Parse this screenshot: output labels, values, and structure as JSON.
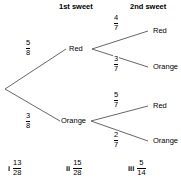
{
  "headers": {
    "first": "1st sweet",
    "second": "2nd sweet"
  },
  "tree": {
    "root_label": "",
    "level1": [
      {
        "label": "Red",
        "probability": {
          "numerator": "5",
          "denominator": "8"
        },
        "children": [
          {
            "label": "Red",
            "probability": {
              "numerator": "4",
              "denominator": "7"
            }
          },
          {
            "label": "Orange",
            "probability": {
              "numerator": "3",
              "denominator": "7"
            }
          }
        ]
      },
      {
        "label": "Orange",
        "probability": {
          "numerator": "3",
          "denominator": "8"
        },
        "children": [
          {
            "label": "Red",
            "probability": {
              "numerator": "5",
              "denominator": "7"
            }
          },
          {
            "label": "Orange",
            "probability": {
              "numerator": "2",
              "denominator": "7"
            }
          }
        ]
      }
    ]
  },
  "answers": [
    {
      "roman": "i",
      "numerator": "13",
      "denominator": "28"
    },
    {
      "roman": "ii",
      "numerator": "15",
      "denominator": "28"
    },
    {
      "roman": "iii",
      "numerator": "5",
      "denominator": "14"
    }
  ],
  "colors": {
    "line": "#555555",
    "text": "#000000",
    "background": "#ffffff"
  }
}
